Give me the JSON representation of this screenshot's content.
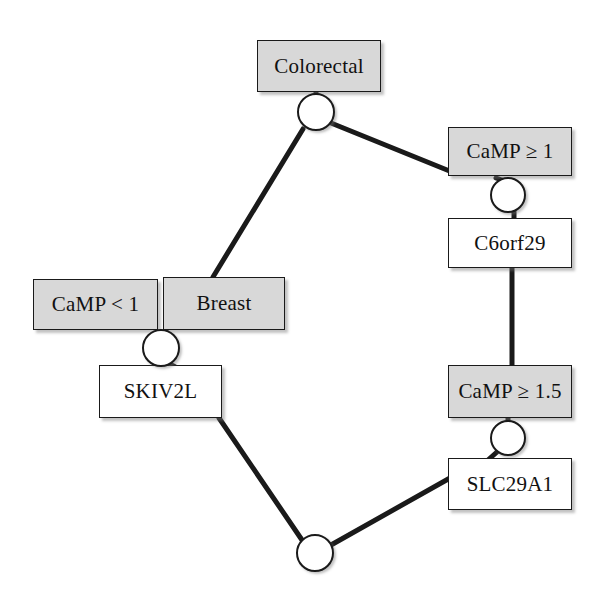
{
  "diagram": {
    "colors": {
      "box_fill_gray": "#d8d8d8",
      "box_fill_white": "#ffffff",
      "stroke": "#1a1a1a",
      "background": "#ffffff"
    },
    "nodes": [
      {
        "id": "colorectal",
        "label": "Colorectal",
        "fill": "gray",
        "x": 257,
        "y": 40,
        "w": 124,
        "h": 52
      },
      {
        "id": "camp_ge_1",
        "label": "CaMP ≥ 1",
        "fill": "gray",
        "x": 448,
        "y": 127,
        "w": 124,
        "h": 49
      },
      {
        "id": "c6orf29",
        "label": "C6orf29",
        "fill": "white",
        "x": 448,
        "y": 218,
        "w": 124,
        "h": 50
      },
      {
        "id": "camp_lt_1",
        "label": "CaMP < 1",
        "fill": "gray",
        "x": 33,
        "y": 279,
        "w": 125,
        "h": 51
      },
      {
        "id": "breast",
        "label": "Breast",
        "fill": "gray",
        "x": 163,
        "y": 277,
        "w": 122,
        "h": 53
      },
      {
        "id": "skiv2l",
        "label": "SKIV2L",
        "fill": "white",
        "x": 99,
        "y": 365,
        "w": 123,
        "h": 53
      },
      {
        "id": "camp_ge_15",
        "label": "CaMP ≥ 1.5",
        "fill": "gray",
        "x": 448,
        "y": 365,
        "w": 124,
        "h": 53
      },
      {
        "id": "slc29a1",
        "label": "SLC29A1",
        "fill": "white",
        "x": 448,
        "y": 458,
        "w": 124,
        "h": 52
      }
    ],
    "junctions": [
      {
        "id": "j-colorectal",
        "cx": 316,
        "cy": 112,
        "r": 19
      },
      {
        "id": "j-camp-ge-1",
        "cx": 508,
        "cy": 195,
        "r": 18
      },
      {
        "id": "j-breast",
        "cx": 161,
        "cy": 348,
        "r": 19
      },
      {
        "id": "j-camp-ge-15",
        "cx": 508,
        "cy": 438,
        "r": 18
      },
      {
        "id": "j-bottom",
        "cx": 315,
        "cy": 553,
        "r": 19
      }
    ],
    "edges": [
      {
        "id": "edge-colorectal-junction",
        "from": "colorectal",
        "to": "j-colorectal",
        "x1": 316,
        "y1": 92,
        "x2": 316,
        "y2": 95
      },
      {
        "id": "edge-junction-camp1",
        "from": "j-colorectal",
        "to": "camp_ge_1",
        "x1": 331,
        "y1": 123,
        "x2": 452,
        "y2": 172
      },
      {
        "id": "edge-junction-breast",
        "from": "j-colorectal",
        "to": "breast",
        "x1": 303,
        "y1": 129,
        "x2": 213,
        "y2": 277
      },
      {
        "id": "edge-camp1-junction",
        "from": "camp_ge_1",
        "to": "j-camp-ge-1",
        "x1": 496,
        "y1": 178,
        "x2": 508,
        "y2": 182
      },
      {
        "id": "edge-junction-c6orf29",
        "from": "j-camp-ge-1",
        "to": "c6orf29",
        "x1": 514,
        "y1": 211,
        "x2": 514,
        "y2": 218
      },
      {
        "id": "edge-c6orf29-camp15",
        "from": "c6orf29",
        "to": "camp_ge_15",
        "x1": 512,
        "y1": 268,
        "x2": 512,
        "y2": 365
      },
      {
        "id": "edge-breast-junction",
        "from": "breast",
        "to": "j-breast",
        "x1": 166,
        "y1": 330,
        "x2": 163,
        "y2": 333
      },
      {
        "id": "edge-junction-skiv2l",
        "from": "j-breast",
        "to": "skiv2l",
        "x1": 168,
        "y1": 363,
        "x2": 177,
        "y2": 368
      },
      {
        "id": "edge-camp15-junction",
        "from": "camp_ge_15",
        "to": "j-camp-ge-15",
        "x1": 508,
        "y1": 418,
        "x2": 508,
        "y2": 422
      },
      {
        "id": "edge-junction-slc29a1",
        "from": "j-camp-ge-15",
        "to": "slc29a1",
        "x1": 497,
        "y1": 452,
        "x2": 488,
        "y2": 460
      },
      {
        "id": "edge-skiv2l-bottom",
        "from": "skiv2l",
        "to": "j-bottom",
        "x1": 219,
        "y1": 418,
        "x2": 302,
        "y2": 540
      },
      {
        "id": "edge-slc29a1-bottom",
        "from": "slc29a1",
        "to": "j-bottom",
        "x1": 450,
        "y1": 478,
        "x2": 331,
        "y2": 545
      }
    ]
  }
}
